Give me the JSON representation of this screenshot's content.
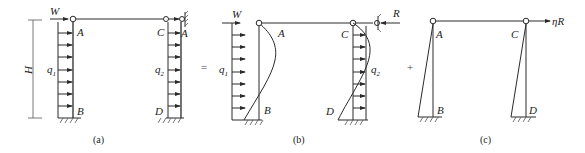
{
  "figure": {
    "panels": [
      {
        "caption": "(a)",
        "labels": {
          "height": "H",
          "wind_point": "W",
          "left_top": "A",
          "left_bottom": "B",
          "right_top": "C",
          "right_bottom": "D",
          "support": "A",
          "load_left": "q",
          "load_left_sub": "1",
          "load_right": "q",
          "load_right_sub": "2"
        }
      },
      {
        "caption": "(b)",
        "operator": "=",
        "labels": {
          "wind_point": "W",
          "left_top": "A",
          "left_bottom": "B",
          "right_top": "C",
          "right_bottom": "D",
          "load_left": "q",
          "load_left_sub": "1",
          "load_right": "q",
          "load_right_sub": "2",
          "reaction": "R"
        }
      },
      {
        "caption": "(c)",
        "operator": "+",
        "labels": {
          "left_top": "A",
          "left_bottom": "B",
          "right_top": "C",
          "right_bottom": "D",
          "applied_force": "ηR"
        }
      }
    ],
    "colors": {
      "line": "#2a2a2a",
      "background": "#ffffff"
    }
  }
}
